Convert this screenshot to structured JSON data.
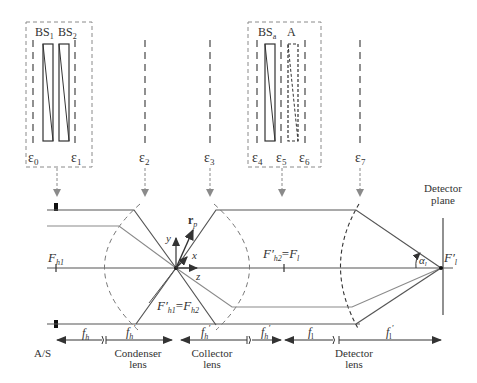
{
  "diagram": {
    "type": "optical-schematic",
    "colors": {
      "line": "#555555",
      "ray_dark": "#555555",
      "ray_light": "#8a8a8a",
      "dashed_box": "#8a8a8a",
      "text": "#333333"
    },
    "module_left": {
      "labels": {
        "bs1": "BS",
        "bs1_sub": "1",
        "bs2": "BS",
        "bs2_sub": "2"
      },
      "planes": [
        {
          "sym": "ε",
          "sub": "0"
        },
        {
          "sym": "ε",
          "sub": "1"
        }
      ]
    },
    "module_right": {
      "labels": {
        "bsa": "BS",
        "bsa_sub": "a",
        "a": "A"
      },
      "planes": [
        {
          "sym": "ε",
          "sub": "4"
        },
        {
          "sym": "ε",
          "sub": "5"
        },
        {
          "sym": "ε",
          "sub": "6"
        }
      ]
    },
    "standalone_planes": [
      {
        "sym": "ε",
        "sub": "2"
      },
      {
        "sym": "ε",
        "sub": "3"
      },
      {
        "sym": "ε",
        "sub": "7"
      }
    ],
    "points": {
      "fh1": {
        "main": "F",
        "sub": "h1"
      },
      "fh1p_fh2": {
        "left": "F′",
        "left_sub": "h1",
        "eq": "=",
        "right": "F",
        "right_sub": "h2"
      },
      "fh2p_fl": {
        "left": "F′",
        "left_sub": "h2",
        "eq": "=",
        "right": "F",
        "right_sub": "l"
      },
      "flp": {
        "main": "F′",
        "sub": "l"
      }
    },
    "axes": {
      "x": "x",
      "y": "y",
      "z": "z",
      "rp": "r",
      "rp_sub": "p"
    },
    "angle": {
      "sym": "α",
      "sub": "l"
    },
    "detector_plane": {
      "line1": "Detector",
      "line2": "plane"
    },
    "focal_lengths": [
      {
        "main": "f",
        "sub": "h",
        "prime": ""
      },
      {
        "main": "f",
        "sub": "h",
        "prime": "′"
      },
      {
        "main": "f",
        "sub": "h",
        "prime": "′"
      },
      {
        "main": "f",
        "sub": "h",
        "prime": "′"
      },
      {
        "main": "f",
        "sub": "l",
        "prime": ""
      },
      {
        "main": "f",
        "sub": "l",
        "prime": "′"
      }
    ],
    "bottom_labels": {
      "as": "A/S",
      "condenser": {
        "line1": "Condenser",
        "line2": "lens"
      },
      "collector": {
        "line1": "Collector",
        "line2": "lens"
      },
      "detector": {
        "line1": "Detector",
        "line2": "lens"
      }
    }
  }
}
